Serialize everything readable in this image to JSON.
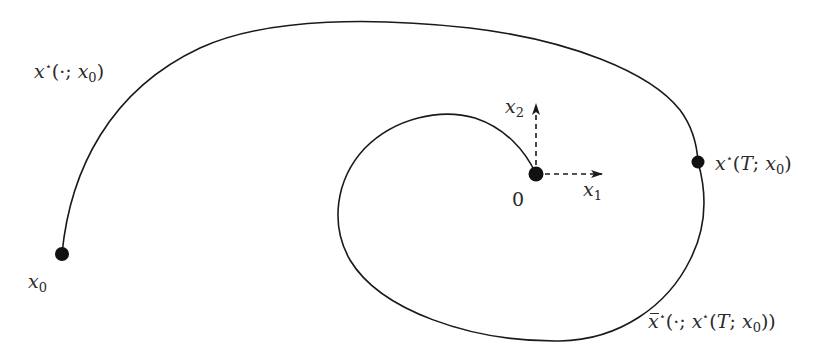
{
  "diagram": {
    "type": "trajectory-phase-diagram",
    "colors": {
      "curve": "#1a1a1a",
      "text": "#2a2a2a",
      "background": "#ffffff"
    },
    "points": {
      "start": {
        "label": "x0",
        "pos": [
          62,
          254
        ]
      },
      "intermediate": {
        "label": "x*(T; x0)",
        "pos": [
          698,
          162
        ]
      },
      "origin": {
        "label": "0",
        "pos": [
          536,
          174
        ]
      }
    },
    "axes": {
      "x1": {
        "label": "x1",
        "from": [
          536,
          174
        ],
        "to": [
          602,
          174
        ],
        "style": "dashed-arrow"
      },
      "x2": {
        "label": "x2",
        "from": [
          536,
          174
        ],
        "to": [
          536,
          104
        ],
        "style": "dashed-arrow"
      }
    },
    "curves": [
      {
        "name": "optimal-trajectory",
        "label": "x*(·; x0)",
        "from": "start",
        "to": "intermediate"
      },
      {
        "name": "continuation-trajectory",
        "label": "x̄*(·; x*(T; x0))",
        "from": "intermediate",
        "to": "origin"
      }
    ],
    "labels": {
      "trajectory_main": {
        "base": "x",
        "sup": "⋆",
        "args_pre": "(·; ",
        "arg_base": "x",
        "arg_sub": "0",
        "args_post": ")"
      },
      "x0": {
        "base": "x",
        "sub": "0"
      },
      "xT": {
        "base": "x",
        "sup": "⋆",
        "pre": "(",
        "T": "T",
        "mid": "; ",
        "arg_base": "x",
        "arg_sub": "0",
        "post": ")"
      },
      "continuation": {
        "base": "x",
        "sup": "⋆",
        "pre": "(·; ",
        "inner_base": "x",
        "inner_sup": "⋆",
        "inner_pre": "(",
        "T": "T",
        "mid": "; ",
        "arg_base": "x",
        "arg_sub": "0",
        "post": "))"
      },
      "origin": "0",
      "x1": {
        "base": "x",
        "sub": "1"
      },
      "x2": {
        "base": "x",
        "sub": "2"
      }
    }
  }
}
